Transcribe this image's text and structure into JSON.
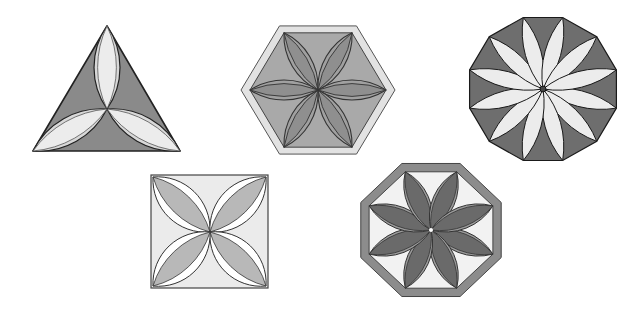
{
  "figure": {
    "shapes": [
      {
        "name": "triangle",
        "sides": 3,
        "petals": 3,
        "fill": "#8a8a8a",
        "petal_fill": "#ececec",
        "stroke": "#222222"
      },
      {
        "name": "hexagon",
        "sides": 6,
        "petals": 6,
        "border_fill": "#e2e2e2",
        "fill": "#a9a9a9",
        "petal_fill": "#8f8f8f",
        "stroke": "#333333"
      },
      {
        "name": "dodecagon",
        "sides": 12,
        "petals": 12,
        "fill": "#6e6e6e",
        "petal_fill": "#ececec",
        "stroke": "#1a1a1a"
      },
      {
        "name": "square",
        "sides": 4,
        "petals": 4,
        "fill": "#ebebeb",
        "petal_fill": "#b8b8b8",
        "petal_outline": "#ffffff",
        "stroke": "#444444"
      },
      {
        "name": "octagon",
        "sides": 8,
        "petals": 8,
        "border_fill": "#8c8c8c",
        "fill": "#f2f2f2",
        "petal_fill": "#6a6a6a",
        "stroke": "#333333"
      }
    ]
  }
}
